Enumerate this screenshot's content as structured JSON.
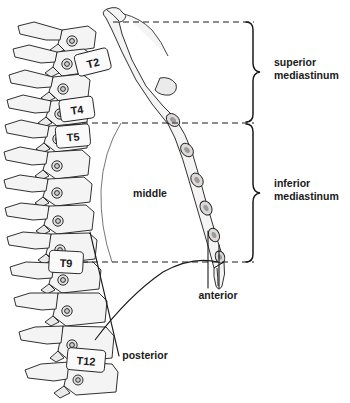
{
  "figure": {
    "background_color": "#ffffff",
    "ink_color": "#1a1a1a",
    "bone_fill": "#f2f2f2",
    "bone_shade": "#d8d8d8",
    "thin_line_color": "#555555"
  },
  "vertebrae_labels": [
    {
      "id": "t2",
      "text": "T2",
      "x": 90,
      "y": 66,
      "box_x": 78,
      "box_y": 53,
      "box_w": 30,
      "box_h": 21,
      "rot": -14
    },
    {
      "id": "t4",
      "text": "T4",
      "x": 74,
      "y": 112,
      "box_x": 62,
      "box_y": 100,
      "box_w": 30,
      "box_h": 20,
      "rot": -8
    },
    {
      "id": "t5",
      "text": "T5",
      "x": 70,
      "y": 139,
      "box_x": 58,
      "box_y": 127,
      "box_w": 30,
      "box_h": 20,
      "rot": -5
    },
    {
      "id": "t9",
      "text": "T9",
      "x": 64,
      "y": 265,
      "box_x": 50,
      "box_y": 253,
      "box_w": 30,
      "box_h": 20,
      "rot": 3
    },
    {
      "id": "t12",
      "text": "T12",
      "x": 82,
      "y": 363,
      "box_x": 68,
      "box_y": 351,
      "box_w": 34,
      "box_h": 20,
      "rot": 5
    }
  ],
  "region_labels": [
    {
      "id": "middle",
      "text": "middle",
      "x": 150,
      "y": 197
    },
    {
      "id": "anterior",
      "text": "anterior",
      "x": 197,
      "y": 298
    },
    {
      "id": "posterior",
      "text": "posterior",
      "x": 114,
      "y": 357
    }
  ],
  "bracket_labels": [
    {
      "id": "superior",
      "line1": "superior",
      "line2": "mediastinum",
      "x": 277,
      "y": 68,
      "line_gap": 13
    },
    {
      "id": "inferior",
      "line1": "inferior",
      "line2": "mediastinum",
      "x": 277,
      "y": 188,
      "line_gap": 13
    }
  ],
  "dashed_lines": [
    {
      "id": "superior-top-boundary",
      "x1": 113,
      "y1": 22,
      "x2": 254,
      "y2": 22
    },
    {
      "id": "superior-inferior-divide",
      "x1": 82,
      "y1": 123,
      "x2": 254,
      "y2": 123
    },
    {
      "id": "inferior-bottom-boundary",
      "x1": 72,
      "y1": 262,
      "x2": 254,
      "y2": 262
    }
  ],
  "brackets": [
    {
      "id": "superior-bracket",
      "x": 252,
      "y_top": 22,
      "y_bottom": 122,
      "tip_x": 264
    },
    {
      "id": "inferior-bracket",
      "x": 252,
      "y_top": 124,
      "y_bottom": 262,
      "tip_x": 264
    }
  ],
  "leader_lines": [
    {
      "id": "anterior-leader-left",
      "x1": 208,
      "y1": 231,
      "x2": 208,
      "y2": 288
    },
    {
      "id": "anterior-leader-right",
      "x1": 219,
      "y1": 245,
      "x2": 219,
      "y2": 288
    },
    {
      "id": "posterior-leader",
      "x1": 90,
      "y1": 232,
      "x2": 119,
      "y2": 356
    }
  ],
  "anatomy": {
    "pericardium_label": "pericardial / middle mediastinum outline",
    "diaphragm_label": "diaphragm dome",
    "sternum_label": "sternum (manubrium and body with costal notches)",
    "spine_label": "thoracic vertebral column T1-T12 with rib heads"
  }
}
